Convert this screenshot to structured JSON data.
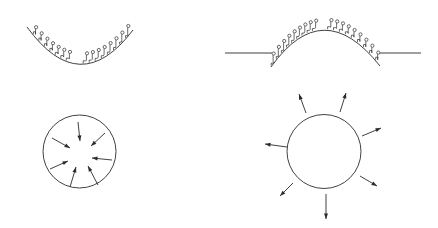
{
  "diagram": {
    "colors": {
      "line": "#2b2b2b",
      "background": "#ffffff"
    },
    "panels": [
      {
        "id": "concave-interface",
        "position": "top-left",
        "arc": {
          "start": [
            27,
            27
          ],
          "control": [
            80,
            100
          ],
          "end": [
            133,
            30
          ]
        },
        "molecules_left_count": 7,
        "molecules_right_count": 8
      },
      {
        "id": "convex-interface",
        "position": "top-right",
        "flat_lines": [
          {
            "x1": 225,
            "x2": 272,
            "y": 53
          },
          {
            "x1": 377,
            "x2": 421,
            "y": 53
          }
        ],
        "arc": {
          "start": [
            271,
            67
          ],
          "control": [
            323,
            -6
          ],
          "end": [
            380,
            66
          ]
        },
        "molecules_left_count": 9,
        "molecules_right_count": 9
      },
      {
        "id": "inward-forces-sphere",
        "position": "bottom-left",
        "circle": {
          "cx": 79.5,
          "cy": 151.5,
          "r": 36.5
        },
        "arrow_direction": "inward",
        "arrow_count": 7
      },
      {
        "id": "outward-forces-sphere",
        "position": "bottom-right",
        "circle": {
          "cx": 324,
          "cy": 151.5,
          "r": 37
        },
        "arrow_direction": "outward",
        "arrow_count": 7
      }
    ]
  }
}
